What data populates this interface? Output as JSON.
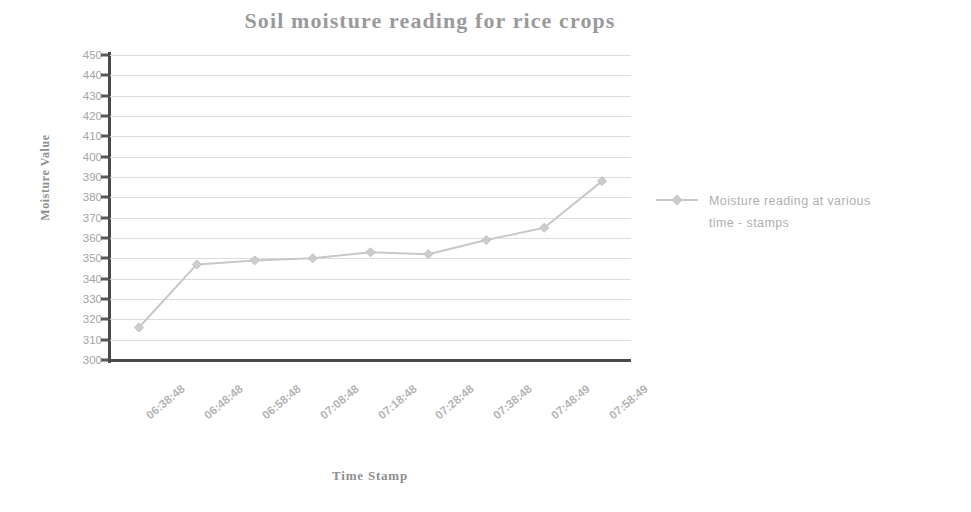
{
  "chart_data": {
    "type": "line",
    "title": "Soil moisture reading for rice crops",
    "xlabel": "Time Stamp",
    "ylabel": "Moisture Value",
    "categories": [
      "06:38:48",
      "06:48:48",
      "06:58:48",
      "07:08:48",
      "07:18:48",
      "07:28:48",
      "07:38:48",
      "07:48:49",
      "07:58:49"
    ],
    "values": [
      316,
      347,
      349,
      350,
      353,
      352,
      359,
      365,
      388
    ],
    "series": [
      {
        "name": "Moisture reading at various time - stamps",
        "values": [
          316,
          347,
          349,
          350,
          353,
          352,
          359,
          365,
          388
        ]
      }
    ],
    "ylim": [
      300,
      450
    ],
    "ytick_step": 10,
    "yticks": [
      450,
      440,
      430,
      420,
      410,
      400,
      390,
      380,
      370,
      360,
      350,
      340,
      330,
      320,
      310,
      300
    ],
    "grid": true,
    "legend_position": "right",
    "line_color": "#c8c8c8",
    "marker": "diamond",
    "axis_color": "#4a4a4a",
    "grid_color": "#dcdcdc",
    "text_color": "#9a9a9a"
  },
  "legend": {
    "label_line1": "Moisture reading at various",
    "label_line2": "time - stamps",
    "symbol_name": "line-with-diamond-marker"
  }
}
